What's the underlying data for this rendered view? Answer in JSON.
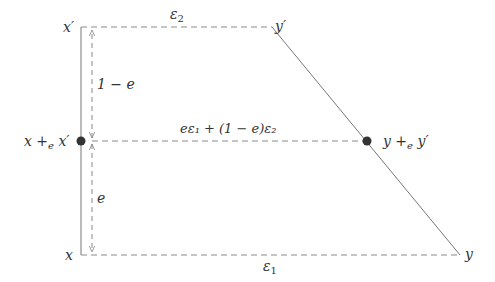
{
  "diagram": {
    "colors": {
      "line": "#777777",
      "dash": "#8a8a8a",
      "dot": "#333333",
      "text": "#333333"
    },
    "points": {
      "x": {
        "label": "x"
      },
      "x_prime": {
        "label": "x′"
      },
      "y": {
        "label": "y"
      },
      "y_prime": {
        "label": "y′"
      },
      "mix_left": {
        "label_main": "x +",
        "label_sub": "e",
        "label_tail": " x′"
      },
      "mix_right": {
        "label_main": "y +",
        "label_sub": "e",
        "label_tail": " y′"
      }
    },
    "edges": {
      "top": {
        "label_base": "ε",
        "label_sub": "2"
      },
      "bottom": {
        "label_base": "ε",
        "label_sub": "1"
      },
      "middle": {
        "label": "eε₁ + (1 − e)ε₂"
      }
    },
    "segments": {
      "upper": {
        "label": "1 − e"
      },
      "lower": {
        "label": "e"
      }
    }
  }
}
